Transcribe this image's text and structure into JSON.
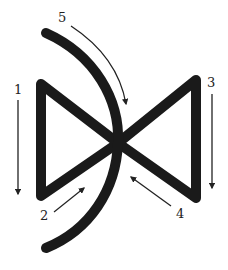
{
  "diagram": {
    "colors": {
      "stroke": "#1a1a1a",
      "arrow": "#222222",
      "background": "#ffffff"
    },
    "shapes": {
      "bowtie": "bowtie-outline",
      "arc": "curved-stroke"
    },
    "labels": [
      {
        "id": "1",
        "text": "1",
        "x": 14,
        "y": 83
      },
      {
        "id": "2",
        "text": "2",
        "x": 40,
        "y": 209
      },
      {
        "id": "3",
        "text": "3",
        "x": 207,
        "y": 76
      },
      {
        "id": "4",
        "text": "4",
        "x": 176,
        "y": 207
      },
      {
        "id": "5",
        "text": "5",
        "x": 58,
        "y": 11
      }
    ]
  }
}
